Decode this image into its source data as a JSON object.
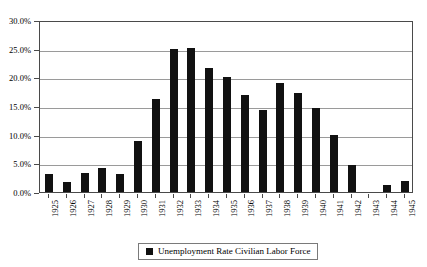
{
  "chart_data": {
    "type": "bar",
    "title": "",
    "xlabel": "",
    "ylabel": "",
    "ylim": [
      0,
      30
    ],
    "ytick_labels": [
      "0.0%",
      "5.0%",
      "10.0%",
      "15.0%",
      "20.0%",
      "25.0%",
      "30.0%"
    ],
    "ytick_values": [
      0,
      5,
      10,
      15,
      20,
      25,
      30
    ],
    "grid": true,
    "legend_position": "bottom",
    "legend": [
      "Unemployment Rate Civilian Labor Force"
    ],
    "series_name": "Unemployment Rate Civilian Labor Force",
    "bar_color": "#111111",
    "categories": [
      "1925",
      "1926",
      "1927",
      "1928",
      "1929",
      "1930",
      "1931",
      "1932",
      "1933",
      "1934",
      "1935",
      "1936",
      "1937",
      "1938",
      "1939",
      "1940",
      "1941",
      "1942",
      "1943",
      "1944",
      "1945"
    ],
    "values": [
      3.2,
      1.8,
      3.3,
      4.2,
      3.2,
      8.9,
      16.3,
      24.9,
      25.2,
      21.7,
      20.1,
      16.9,
      14.3,
      19.0,
      17.2,
      14.6,
      9.9,
      4.7,
      0.0,
      1.2,
      1.9
    ]
  },
  "legend": {
    "label": "Unemployment Rate Civilian Labor Force"
  },
  "title": {
    "text": ""
  }
}
